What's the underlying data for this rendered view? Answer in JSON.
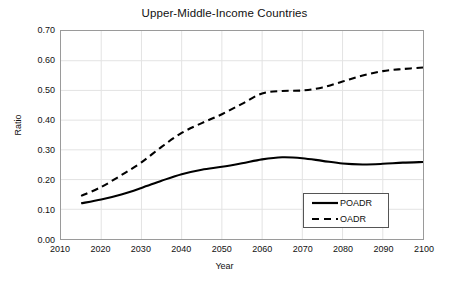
{
  "chart_data": {
    "type": "line",
    "title": "Upper-Middle-Income Countries",
    "xlabel": "Year",
    "ylabel": "Ratio",
    "xlim": [
      2010,
      2100
    ],
    "ylim": [
      0.0,
      0.7
    ],
    "grid": true,
    "legend_position": "bottom-right",
    "xticks": [
      "2010",
      "2020",
      "2030",
      "2040",
      "2050",
      "2060",
      "2070",
      "2080",
      "2090",
      "2100"
    ],
    "yticks": [
      "0.00",
      "0.10",
      "0.20",
      "0.30",
      "0.40",
      "0.50",
      "0.60",
      "0.70"
    ],
    "x": [
      2015,
      2020,
      2025,
      2030,
      2035,
      2040,
      2045,
      2050,
      2055,
      2060,
      2065,
      2070,
      2075,
      2080,
      2085,
      2090,
      2095,
      2100
    ],
    "series": [
      {
        "name": "POADR",
        "style": "solid",
        "color": "#000000",
        "values": [
          0.12,
          0.133,
          0.15,
          0.172,
          0.196,
          0.218,
          0.233,
          0.243,
          0.255,
          0.268,
          0.275,
          0.272,
          0.263,
          0.254,
          0.251,
          0.253,
          0.257,
          0.259
        ]
      },
      {
        "name": "OADR",
        "style": "dashed",
        "color": "#000000",
        "values": [
          0.145,
          0.175,
          0.215,
          0.258,
          0.31,
          0.357,
          0.39,
          0.42,
          0.455,
          0.49,
          0.498,
          0.5,
          0.51,
          0.53,
          0.55,
          0.565,
          0.572,
          0.577
        ]
      }
    ]
  },
  "legend": {
    "items": [
      {
        "label": "POADR"
      },
      {
        "label": "OADR"
      }
    ]
  }
}
